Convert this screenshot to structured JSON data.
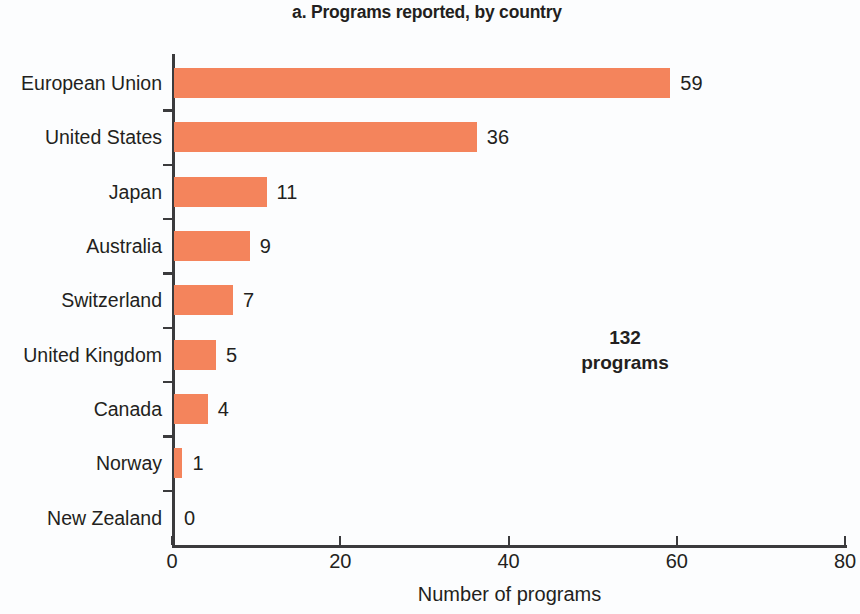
{
  "chart_data": {
    "type": "bar",
    "orientation": "horizontal",
    "title": "a. Programs reported, by country",
    "xlabel": "Number of programs",
    "ylabel": "",
    "categories": [
      "European Union",
      "United States",
      "Japan",
      "Australia",
      "Switzerland",
      "United Kingdom",
      "Canada",
      "Norway",
      "New Zealand"
    ],
    "values": [
      59,
      36,
      11,
      9,
      7,
      5,
      4,
      1,
      0
    ],
    "value_labels": [
      "59",
      "36",
      "11",
      "9",
      "7",
      "5",
      "4",
      "1",
      "0"
    ],
    "xlim": [
      0,
      80
    ],
    "xticks": [
      0,
      20,
      40,
      60,
      80
    ],
    "xtick_labels": [
      "0",
      "20",
      "40",
      "60",
      "80"
    ],
    "grid": false,
    "legend": null,
    "annotations": [
      {
        "name": "total-programs",
        "line1": "132",
        "line2": "programs"
      }
    ],
    "colors": {
      "bar": "#F4845C",
      "axis": "#3B3B3D",
      "text": "#231F20",
      "background": "#FCFDFE"
    }
  }
}
